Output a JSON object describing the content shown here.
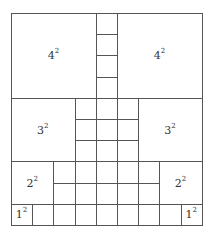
{
  "diagram": {
    "grid": {
      "cols": 9,
      "rows": 10,
      "unit": 21.2
    },
    "line_color": "#555555",
    "squares": [
      {
        "id": "sq4-left",
        "base": "4",
        "exp": "2",
        "x": 0,
        "y": 0,
        "size": 4
      },
      {
        "id": "sq4-right",
        "base": "4",
        "exp": "2",
        "x": 5,
        "y": 0,
        "size": 4
      },
      {
        "id": "sq3-left",
        "base": "3",
        "exp": "2",
        "x": 0,
        "y": 4,
        "size": 3
      },
      {
        "id": "sq3-right",
        "base": "3",
        "exp": "2",
        "x": 6,
        "y": 4,
        "size": 3
      },
      {
        "id": "sq2-left",
        "base": "2",
        "exp": "2",
        "x": 0,
        "y": 7,
        "size": 2
      },
      {
        "id": "sq2-right",
        "base": "2",
        "exp": "2",
        "x": 7,
        "y": 7,
        "size": 2
      },
      {
        "id": "sq1-left",
        "base": "1",
        "exp": "2",
        "x": 0,
        "y": 9,
        "size": 1
      },
      {
        "id": "sq1-right",
        "base": "1",
        "exp": "2",
        "x": 8,
        "y": 9,
        "size": 1
      }
    ],
    "unit_regions": [
      {
        "x0": 4,
        "x1": 5,
        "y0": 0,
        "y1": 4
      },
      {
        "x0": 3,
        "x1": 6,
        "y0": 4,
        "y1": 7
      },
      {
        "x0": 2,
        "x1": 7,
        "y0": 7,
        "y1": 9
      },
      {
        "x0": 1,
        "x1": 8,
        "y0": 9,
        "y1": 10
      }
    ]
  }
}
